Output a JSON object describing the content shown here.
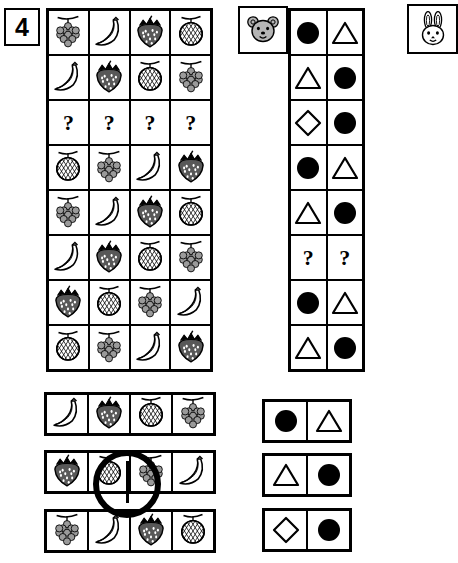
{
  "problem": {
    "number": "4"
  },
  "legend": {
    "bear_icon": "bear-head-icon",
    "rabbit_icon": "rabbit-head-icon"
  },
  "fruit_matrix": {
    "columns": 4,
    "rows": 8,
    "cells": [
      [
        "grapes",
        "banana",
        "strawberry",
        "melon"
      ],
      [
        "banana",
        "strawberry",
        "melon",
        "grapes"
      ],
      [
        "?",
        "?",
        "?",
        "?"
      ],
      [
        "melon",
        "grapes",
        "banana",
        "strawberry"
      ],
      [
        "grapes",
        "banana",
        "strawberry",
        "melon"
      ],
      [
        "banana",
        "strawberry",
        "melon",
        "grapes"
      ],
      [
        "strawberry",
        "melon",
        "grapes",
        "banana"
      ],
      [
        "melon",
        "grapes",
        "banana",
        "strawberry"
      ]
    ]
  },
  "shape_matrix": {
    "columns": 2,
    "rows": 8,
    "cells": [
      [
        "circle",
        "triangle"
      ],
      [
        "triangle",
        "circle"
      ],
      [
        "diamond",
        "circle"
      ],
      [
        "circle",
        "triangle"
      ],
      [
        "triangle",
        "circle"
      ],
      [
        "?",
        "?"
      ],
      [
        "circle",
        "triangle"
      ],
      [
        "triangle",
        "circle"
      ]
    ]
  },
  "fruit_options": [
    {
      "label": "option-1",
      "cells": [
        "banana",
        "strawberry",
        "melon",
        "grapes"
      ],
      "selected": false
    },
    {
      "label": "option-2",
      "cells": [
        "strawberry",
        "melon",
        "grapes",
        "banana"
      ],
      "selected": true
    },
    {
      "label": "option-3",
      "cells": [
        "grapes",
        "banana",
        "strawberry",
        "melon"
      ],
      "selected": false
    }
  ],
  "shape_options": [
    {
      "label": "option-1",
      "cells": [
        "circle",
        "triangle"
      ],
      "selected": false
    },
    {
      "label": "option-2",
      "cells": [
        "triangle",
        "circle"
      ],
      "selected": false
    },
    {
      "label": "option-3",
      "cells": [
        "diamond",
        "circle"
      ],
      "selected": false
    }
  ],
  "symbols": {
    "question": "?"
  },
  "colors": {
    "ink": "#000000",
    "paper": "#ffffff",
    "fruit_fill": "#9a9a9a",
    "animal_fill": "#b5b5b5"
  }
}
